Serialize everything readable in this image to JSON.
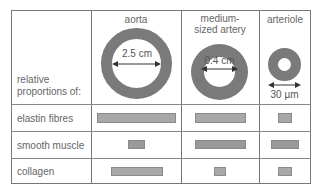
{
  "row_header_label": "relative proportions of:",
  "row_header_lines": [
    "relative",
    "proportions of:"
  ],
  "columns": [
    {
      "name": "aorta",
      "name_lines": [
        "aorta"
      ],
      "diameter_label": "2.5 cm"
    },
    {
      "name": "medium-sized artery",
      "name_lines": [
        "medium-",
        "sized artery"
      ],
      "diameter_label": "0.4 cm"
    },
    {
      "name": "arteriole",
      "name_lines": [
        "arteriole"
      ],
      "diameter_label": "30 µm"
    }
  ],
  "rows": [
    {
      "label": "elastin fibres",
      "relative_bar_widths": [
        78,
        52,
        14
      ]
    },
    {
      "label": "smooth muscle",
      "relative_bar_widths": [
        16,
        52,
        28
      ]
    },
    {
      "label": "collagen",
      "relative_bar_widths": [
        52,
        12,
        14
      ]
    }
  ],
  "colors": {
    "ring": "#7a7a7a",
    "bar_fill": "#a8a8a8",
    "bar_border": "#8a8a8a",
    "grid": "#777777",
    "text": "#666666"
  }
}
